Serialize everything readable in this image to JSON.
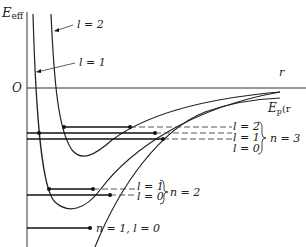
{
  "diagram": {
    "axes": {
      "y_label_main": "E",
      "y_label_sub": "eff",
      "origin_label": "O",
      "x_label": "r"
    },
    "curves": {
      "potential_label_main": "E",
      "potential_label_sub": "p",
      "potential_label_suffix": "(r",
      "l2_label": "l = 2",
      "l1_label": "l = 1"
    },
    "levels": {
      "n3": {
        "group_label": "n = 3",
        "l2": "l = 2",
        "l1": "l = 1",
        "l0": "l = 0"
      },
      "n2": {
        "group_label": "n = 2",
        "l1": "l = 1",
        "l0": "l = 0"
      },
      "n1": {
        "label": "n = 1, l = 0"
      }
    },
    "colors": {
      "ink": "#222222",
      "background": "#ffffff"
    }
  }
}
